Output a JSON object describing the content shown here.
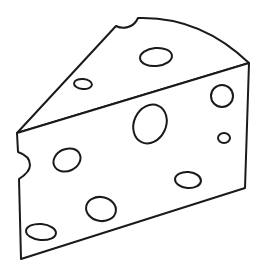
{
  "image": {
    "subject": "cheese wedge line art",
    "background_color": "#ffffff",
    "stroke_color": "#1a1a1a"
  },
  "holes": [
    {
      "cx": 156,
      "cy": 57,
      "rx": 16,
      "ry": 9,
      "rot": -5
    },
    {
      "cx": 83,
      "cy": 84,
      "rx": 9,
      "ry": 5,
      "rot": 5
    },
    {
      "cx": 222,
      "cy": 96,
      "rx": 11,
      "ry": 11,
      "rot": 0
    },
    {
      "cx": 150,
      "cy": 124,
      "rx": 16,
      "ry": 20,
      "rot": 25
    },
    {
      "cx": 224,
      "cy": 138,
      "rx": 6,
      "ry": 5,
      "rot": 0
    },
    {
      "cx": 67,
      "cy": 160,
      "rx": 14,
      "ry": 11,
      "rot": -25
    },
    {
      "cx": 188,
      "cy": 180,
      "rx": 13,
      "ry": 8,
      "rot": 5
    },
    {
      "cx": 101,
      "cy": 209,
      "rx": 15,
      "ry": 12,
      "rot": 10
    },
    {
      "cx": 41,
      "cy": 232,
      "rx": 15,
      "ry": 8,
      "rot": 5
    }
  ]
}
